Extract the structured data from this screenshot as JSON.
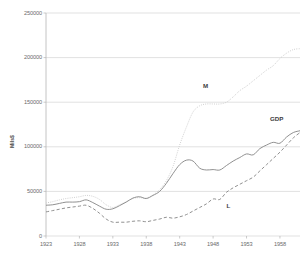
{
  "chart_data": {
    "type": "line",
    "title": "",
    "xlabel": "",
    "ylabel": "Mils$",
    "xlim": [
      1923,
      1961
    ],
    "ylim": [
      0,
      250000
    ],
    "grid": true,
    "legend_position": "inline-annotations",
    "y_ticks": [
      0,
      50000,
      100000,
      150000,
      200000,
      250000
    ],
    "y_tick_labels": [
      "0",
      "50000",
      "100000",
      "150000",
      "200000",
      "250000"
    ],
    "x_ticks": [
      1923,
      1928,
      1933,
      1938,
      1943,
      1948,
      1953,
      1958
    ],
    "x_tick_labels": [
      "1923",
      "1928",
      "1933",
      "1938",
      "1943",
      "1948",
      "1953",
      "1958"
    ],
    "x": [
      1923,
      1924,
      1925,
      1926,
      1927,
      1928,
      1929,
      1930,
      1931,
      1932,
      1933,
      1934,
      1935,
      1936,
      1937,
      1938,
      1939,
      1940,
      1941,
      1942,
      1943,
      1944,
      1945,
      1946,
      1947,
      1948,
      1949,
      1950,
      1951,
      1952,
      1953,
      1954,
      1955,
      1956,
      1957,
      1958,
      1959,
      1960,
      1961
    ],
    "series": [
      {
        "name": "M",
        "style": "dotted",
        "color": "#c9c9c9",
        "values": [
          37000,
          38500,
          40500,
          42000,
          43000,
          44000,
          45500,
          44500,
          41000,
          35000,
          32000,
          35000,
          38500,
          42000,
          43000,
          42500,
          46000,
          52000,
          62000,
          78000,
          102000,
          122000,
          139000,
          146000,
          148000,
          148000,
          148000,
          150000,
          156000,
          163000,
          168000,
          174000,
          180000,
          186000,
          191000,
          199000,
          205000,
          209000,
          210000
        ]
      },
      {
        "name": "GDP",
        "style": "solid",
        "color": "#8a8a8a",
        "values": [
          34500,
          35000,
          36500,
          38000,
          38000,
          38500,
          40500,
          37500,
          33500,
          30000,
          30500,
          34000,
          38000,
          42500,
          44000,
          42000,
          45500,
          50000,
          59000,
          70000,
          80000,
          85000,
          84000,
          76000,
          74000,
          74500,
          74000,
          79000,
          84000,
          88000,
          92000,
          91000,
          98000,
          102000,
          105000,
          104000,
          111000,
          116000,
          118000
        ]
      },
      {
        "name": "L",
        "style": "dashed",
        "color": "#8a8a8a",
        "values": [
          27000,
          28500,
          30000,
          31500,
          32500,
          33500,
          34500,
          31000,
          25500,
          19000,
          15500,
          15500,
          15500,
          16500,
          17000,
          16000,
          17500,
          19000,
          21000,
          20000,
          21500,
          24000,
          28000,
          32000,
          36000,
          41500,
          41000,
          49000,
          54000,
          58000,
          62000,
          66000,
          73000,
          80000,
          87000,
          94000,
          102000,
          110000,
          116000
        ]
      }
    ],
    "annotations": [
      {
        "text": "M",
        "x_value": 1946.5,
        "y_value": 168000
      },
      {
        "text": "GDP",
        "x_value": 1956.5,
        "y_value": 131000
      },
      {
        "text": "L",
        "x_value": 1950.0,
        "y_value": 34000
      }
    ]
  },
  "colors": {
    "gridline": "#d4d4d4",
    "axis": "#b5b5b5",
    "tick_text": "#6b6b6b",
    "label_text": "#3d3d3d",
    "background": "#ffffff"
  }
}
